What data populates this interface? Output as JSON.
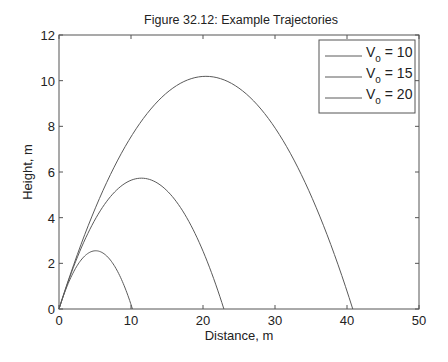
{
  "chart_data": {
    "type": "line",
    "title": "Figure 32.12: Example Trajectories",
    "xlabel": "Distance, m",
    "ylabel": "Height, m",
    "xlim": [
      0,
      50
    ],
    "ylim": [
      0,
      12
    ],
    "xticks": [
      0,
      10,
      20,
      30,
      40,
      50
    ],
    "yticks": [
      0,
      2,
      4,
      6,
      8,
      10,
      12
    ],
    "grid": false,
    "legend_position": "upper right",
    "series": [
      {
        "name": "V_o = 10",
        "v0": 10,
        "range": 10.2,
        "peak_x": 5.1,
        "peak_y": 2.55
      },
      {
        "name": "V_o = 15",
        "v0": 15,
        "range": 22.9,
        "peak_x": 11.5,
        "peak_y": 5.73
      },
      {
        "name": "V_o = 20",
        "v0": 20,
        "range": 40.8,
        "peak_x": 20.4,
        "peak_y": 10.19
      }
    ],
    "legend": [
      {
        "main": "V",
        "sub": "o",
        "rest": " = 10"
      },
      {
        "main": "V",
        "sub": "o",
        "rest": " = 15"
      },
      {
        "main": "V",
        "sub": "o",
        "rest": " = 20"
      }
    ],
    "colors": {
      "line": "#5a5a5a",
      "axis": "#555555"
    }
  }
}
